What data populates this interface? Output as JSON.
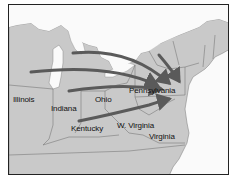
{
  "map": {
    "title": "",
    "colors": {
      "land": "#c9c9c9",
      "water": "#fafafa",
      "border": "#7a7a7a",
      "arrow": "#5a5a5a",
      "frame": "#222222"
    },
    "labels": [
      {
        "id": "illinois",
        "text": "Illinois",
        "x": 12,
        "y": 96
      },
      {
        "id": "indiana",
        "text": "Indiana",
        "x": 49,
        "y": 104
      },
      {
        "id": "ohio",
        "text": "Ohio",
        "x": 94,
        "y": 93
      },
      {
        "id": "pennsylvania",
        "text": "Pennsylvania",
        "x": 128,
        "y": 84
      },
      {
        "id": "kentucky",
        "text": "Kentucky",
        "x": 70,
        "y": 124
      },
      {
        "id": "w-virginia",
        "text": "W. Virginia",
        "x": 116,
        "y": 121
      },
      {
        "id": "virginia",
        "text": "Virginia",
        "x": 147,
        "y": 131
      }
    ],
    "arrows": [
      {
        "id": "arrow-michigan-north",
        "from": "Michigan (north)",
        "to": "Pennsylvania"
      },
      {
        "id": "arrow-michigan-south",
        "from": "Michigan / Lake Michigan",
        "to": "Pennsylvania"
      },
      {
        "id": "arrow-ohio",
        "from": "Indiana / Ohio",
        "to": "Pennsylvania"
      },
      {
        "id": "arrow-kentucky",
        "from": "Indiana / Kentucky",
        "to": "Pennsylvania"
      },
      {
        "id": "arrow-new-york",
        "from": "New York",
        "to": "Pennsylvania"
      }
    ]
  }
}
